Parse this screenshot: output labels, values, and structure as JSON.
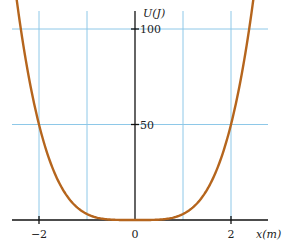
{
  "chart_data": {
    "type": "line",
    "title": "",
    "xlabel": "x(m)",
    "ylabel": "U(J)",
    "xlim": [
      -2.55,
      2.75
    ],
    "ylim": [
      0,
      100
    ],
    "grid": true,
    "x_gridlines": [
      -2,
      -1,
      1,
      2
    ],
    "y_gridlines": [
      50,
      100
    ],
    "x_ticks": [
      -2,
      0,
      2
    ],
    "x_tick_labels": [
      "−2",
      "0",
      "2"
    ],
    "y_ticks": [
      50,
      100
    ],
    "y_tick_labels": [
      "50",
      "100"
    ],
    "series": [
      {
        "name": "U(x)",
        "formula": "U = 3.125 x^4",
        "x": [
          -2.5,
          -2.25,
          -2.0,
          -1.75,
          -1.5,
          -1.25,
          -1.0,
          -0.75,
          -0.5,
          -0.25,
          0,
          0.25,
          0.5,
          0.75,
          1.0,
          1.25,
          1.5,
          1.75,
          2.0,
          2.25,
          2.5
        ],
        "values": [
          100,
          80.1,
          50,
          29.3,
          15.8,
          7.6,
          3.1,
          1.0,
          0.2,
          0.01,
          0,
          0.01,
          0.2,
          1.0,
          3.1,
          7.6,
          15.8,
          29.3,
          50,
          80.1,
          100
        ]
      }
    ],
    "colors": {
      "curve": "#b5651d",
      "grid": "#8ec8e8",
      "axis": "#111111"
    }
  },
  "labels": {
    "xlabel": "x(m)",
    "ylabel": "U(J)",
    "y100": "100",
    "y50": "50",
    "xm2": "−2",
    "x0": "0",
    "x2": "2"
  }
}
